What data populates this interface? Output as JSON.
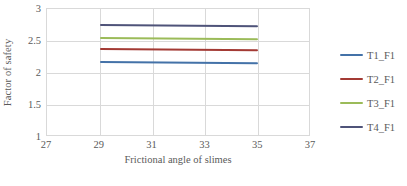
{
  "chart_data": {
    "type": "line",
    "title": "",
    "xlabel": "Frictional angle of slimes",
    "ylabel": "Factor of safety",
    "xlim": [
      27,
      37
    ],
    "ylim": [
      1,
      3
    ],
    "xticks": [
      27,
      29,
      31,
      33,
      35,
      37
    ],
    "yticks": [
      1,
      1.5,
      2,
      2.5,
      3
    ],
    "xtick_labels": [
      "27",
      "29",
      "31",
      "33",
      "35",
      "37"
    ],
    "ytick_labels": [
      "1",
      "1.5",
      "2",
      "2.5",
      "3"
    ],
    "grid": "both",
    "legend_position": "right",
    "x": [
      29,
      35
    ],
    "series": [
      {
        "name": "T1_F1",
        "values": [
          2.19,
          2.17
        ],
        "color": "#4472A8"
      },
      {
        "name": "T2_F1",
        "values": [
          2.39,
          2.37
        ],
        "color": "#A33A34"
      },
      {
        "name": "T3_F1",
        "values": [
          2.57,
          2.55
        ],
        "color": "#9BBB59"
      },
      {
        "name": "T4_F1",
        "values": [
          2.76,
          2.74
        ],
        "color": "#4F5379"
      }
    ]
  }
}
